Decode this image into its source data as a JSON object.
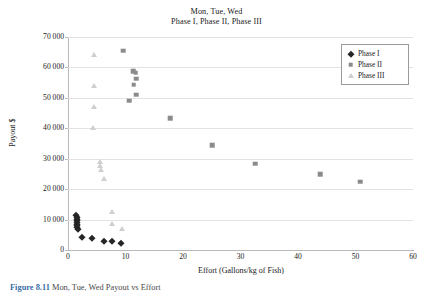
{
  "title": {
    "line1": "Mon, Tue, Wed",
    "line2": "Phase I, Phase II, Phase III"
  },
  "axes": {
    "y_label": "Payout $",
    "x_label": "Effort (Gallons/kg of Fish)",
    "y_ticks": [
      "0",
      "10 000",
      "20 000",
      "30 000",
      "40 000",
      "50 000",
      "60 000",
      "70 000"
    ],
    "x_ticks": [
      "0",
      "10",
      "20",
      "30",
      "40",
      "50",
      "60"
    ]
  },
  "legend": {
    "items": [
      {
        "label": "Phase I",
        "marker": "diamond",
        "color": "#262626"
      },
      {
        "label": "Phase II",
        "marker": "square",
        "color": "#8b8b8b"
      },
      {
        "label": "Phase III",
        "marker": "triangle",
        "color": "#cfcfcf"
      }
    ]
  },
  "caption": {
    "number": "Figure 8.11",
    "text": "Mon, Tue, Wed Payout vs Effort"
  },
  "chart_data": {
    "type": "scatter",
    "xlabel": "Effort (Gallons/kg of Fish)",
    "ylabel": "Payout $",
    "xlim": [
      0,
      60
    ],
    "ylim": [
      0,
      70000
    ],
    "xticks": [
      0,
      10,
      20,
      30,
      40,
      50,
      60
    ],
    "yticks": [
      0,
      10000,
      20000,
      30000,
      40000,
      50000,
      60000,
      70000
    ],
    "grid": "horizontal",
    "legend_position": "top-right",
    "series": [
      {
        "name": "Phase I",
        "marker": "diamond",
        "color": "#262626",
        "points": [
          [
            1.4,
            11400
          ],
          [
            1.5,
            10900
          ],
          [
            1.5,
            10300
          ],
          [
            1.6,
            9800
          ],
          [
            1.5,
            9200
          ],
          [
            1.6,
            8700
          ],
          [
            1.5,
            8100
          ],
          [
            1.6,
            7500
          ],
          [
            1.7,
            6900
          ],
          [
            2.4,
            4400
          ],
          [
            4.2,
            3900
          ],
          [
            6.3,
            3100
          ],
          [
            7.6,
            3000
          ],
          [
            9.3,
            2300
          ]
        ]
      },
      {
        "name": "Phase II",
        "marker": "square",
        "color": "#8b8b8b",
        "points": [
          [
            9.6,
            65500
          ],
          [
            11.3,
            58700
          ],
          [
            11.8,
            58200
          ],
          [
            11.9,
            56300
          ],
          [
            11.4,
            54300
          ],
          [
            11.9,
            51100
          ],
          [
            10.6,
            49000
          ],
          [
            17.8,
            43400
          ],
          [
            25.1,
            34500
          ],
          [
            32.6,
            28300
          ],
          [
            43.9,
            25000
          ],
          [
            50.8,
            22400
          ]
        ]
      },
      {
        "name": "Phase III",
        "marker": "triangle",
        "color": "#cfcfcf",
        "points": [
          [
            4.6,
            64000
          ],
          [
            4.5,
            54000
          ],
          [
            4.5,
            47000
          ],
          [
            4.4,
            40200
          ],
          [
            5.6,
            28900
          ],
          [
            5.6,
            27700
          ],
          [
            5.7,
            26400
          ],
          [
            6.2,
            23200
          ],
          [
            7.7,
            12400
          ],
          [
            7.7,
            8600
          ],
          [
            9.4,
            6800
          ]
        ]
      }
    ]
  }
}
